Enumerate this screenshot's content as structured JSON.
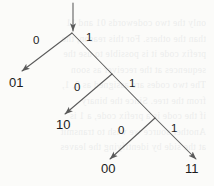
{
  "diagram": {
    "type": "binary-prefix-code-tree",
    "root_arrow": {
      "name": "root-input-arrow",
      "from": [
        73,
        3
      ],
      "to": [
        73,
        31
      ]
    },
    "nodes": [
      {
        "id": "root",
        "x": 72,
        "y": 33
      },
      {
        "id": "n2",
        "x": 112,
        "y": 74
      },
      {
        "id": "n3",
        "x": 155,
        "y": 118
      }
    ],
    "edges": [
      {
        "id": "root-0",
        "label": "0",
        "from": [
          72,
          33
        ],
        "to": [
          22,
          71
        ],
        "label_x": 33,
        "label_y": 34
      },
      {
        "id": "root-1",
        "label": "1",
        "from": [
          72,
          33
        ],
        "to": [
          112,
          74
        ],
        "label_x": 86,
        "label_y": 31
      },
      {
        "id": "n2-0",
        "label": "0",
        "from": [
          112,
          74
        ],
        "to": [
          65,
          114
        ],
        "label_x": 74,
        "label_y": 81
      },
      {
        "id": "n2-1",
        "label": "1",
        "from": [
          112,
          74
        ],
        "to": [
          155,
          118
        ],
        "label_x": 129,
        "label_y": 77
      },
      {
        "id": "n3-0",
        "label": "0",
        "from": [
          155,
          118
        ],
        "to": [
          110,
          159
        ],
        "label_x": 118,
        "label_y": 124
      },
      {
        "id": "n3-1",
        "label": "1",
        "from": [
          155,
          118
        ],
        "to": [
          196,
          159
        ],
        "label_x": 171,
        "label_y": 122
      }
    ],
    "leaves": [
      {
        "id": "leaf-01",
        "label": "01",
        "x": 9,
        "y": 75
      },
      {
        "id": "leaf-10",
        "label": "10",
        "x": 56,
        "y": 117
      },
      {
        "id": "leaf-00",
        "label": "00",
        "x": 101,
        "y": 161
      },
      {
        "id": "leaf-11",
        "label": "11",
        "x": 185,
        "y": 161
      }
    ],
    "colors": {
      "ink": "#1c1c1c",
      "line": "#5a5a5a",
      "paper": "#fbfbf9"
    }
  },
  "background_text": {
    "note": "faint show-through text from reverse of scanned page",
    "lines": [
      "only the two codewords 01 and 11",
      "than the others. For this reason, the",
      "prefix code it is possible to use the",
      "sequences at the receiver as soon",
      "",
      "",
      "",
      "The two codes are assigned as 0, 1,",
      "from the tree. Since the binary",
      "if the code is a prefix code, a 1 is",
      "Another source we wish to transmit",
      "at the side by identifying the leaves"
    ]
  }
}
